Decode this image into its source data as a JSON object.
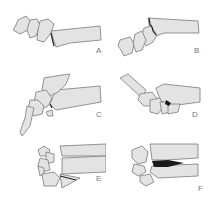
{
  "figure": {
    "panels": [
      {
        "id": "A",
        "label": "A"
      },
      {
        "id": "B",
        "label": "B"
      },
      {
        "id": "C",
        "label": "C"
      },
      {
        "id": "D",
        "label": "D"
      },
      {
        "id": "E",
        "label": "E"
      },
      {
        "id": "F",
        "label": "F"
      }
    ]
  },
  "colors": {
    "bone_fill": "#e3e3e3",
    "bone_outline": "#7a7a7a",
    "fracture_line": "#222222",
    "label_text": "#777777",
    "background": "#ffffff"
  }
}
